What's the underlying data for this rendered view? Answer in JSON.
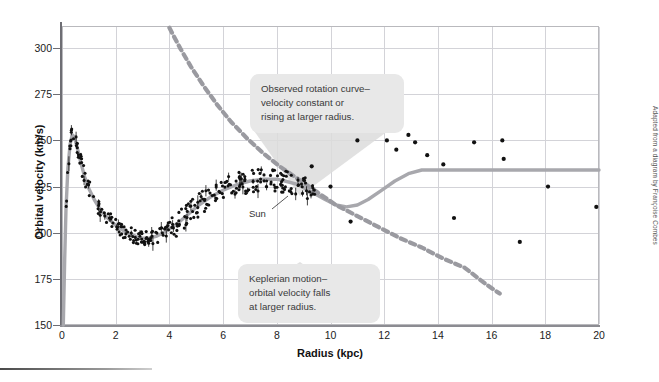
{
  "chart_data": {
    "type": "scatter",
    "title": "",
    "xlabel": "Radius (kpc)",
    "ylabel": "Orbital velocity (km/s)",
    "xlim": [
      0,
      20
    ],
    "ylim": [
      150,
      312
    ],
    "xticks": [
      0,
      2,
      4,
      6,
      8,
      10,
      12,
      14,
      16,
      18,
      20
    ],
    "yticks": [
      150,
      175,
      200,
      225,
      250,
      275,
      300
    ],
    "grid": true,
    "legend": "none",
    "series": [
      {
        "name": "Observed rotation curve (model)",
        "type": "line",
        "style": "solid",
        "color": "#a8a8ad",
        "points": [
          [
            0.05,
            150
          ],
          [
            0.1,
            186
          ],
          [
            0.15,
            213
          ],
          [
            0.22,
            235
          ],
          [
            0.3,
            248
          ],
          [
            0.38,
            253
          ],
          [
            0.46,
            252
          ],
          [
            0.55,
            247
          ],
          [
            0.7,
            238
          ],
          [
            0.85,
            230
          ],
          [
            1.0,
            224
          ],
          [
            1.2,
            218
          ],
          [
            1.45,
            212
          ],
          [
            1.7,
            208
          ],
          [
            2.0,
            204
          ],
          [
            2.3,
            201
          ],
          [
            2.6,
            199
          ],
          [
            2.9,
            197
          ],
          [
            3.2,
            197
          ],
          [
            3.5,
            198
          ],
          [
            3.9,
            201
          ],
          [
            4.3,
            205
          ],
          [
            4.7,
            210
          ],
          [
            5.1,
            215
          ],
          [
            5.5,
            219
          ],
          [
            6.0,
            223
          ],
          [
            6.5,
            226
          ],
          [
            7.0,
            228
          ],
          [
            7.5,
            229
          ],
          [
            8.0,
            229
          ],
          [
            8.3,
            228
          ],
          [
            8.8,
            226
          ],
          [
            9.3,
            222
          ],
          [
            9.8,
            218
          ],
          [
            10.2,
            215
          ],
          [
            10.6,
            214
          ],
          [
            11.0,
            215
          ],
          [
            11.4,
            218
          ],
          [
            11.9,
            223
          ],
          [
            12.4,
            228
          ],
          [
            12.9,
            232
          ],
          [
            13.4,
            234
          ],
          [
            14.0,
            234
          ],
          [
            15.0,
            234
          ],
          [
            16.0,
            234
          ],
          [
            17.0,
            234
          ],
          [
            18.0,
            234
          ],
          [
            19.0,
            234
          ],
          [
            20.0,
            234
          ]
        ]
      },
      {
        "name": "Keplerian motion",
        "type": "line",
        "style": "dashed",
        "color": "#9a9aa0",
        "points": [
          [
            4.0,
            311
          ],
          [
            4.4,
            300
          ],
          [
            4.8,
            290
          ],
          [
            5.3,
            279
          ],
          [
            5.8,
            269
          ],
          [
            6.3,
            260
          ],
          [
            6.9,
            251
          ],
          [
            7.5,
            243
          ],
          [
            8.1,
            236
          ],
          [
            8.8,
            229
          ],
          [
            9.5,
            222
          ],
          [
            10.2,
            215
          ],
          [
            11.0,
            209
          ],
          [
            11.8,
            203
          ],
          [
            12.6,
            197
          ],
          [
            13.4,
            192
          ],
          [
            14.2,
            186
          ],
          [
            15.0,
            181
          ],
          [
            15.8,
            172
          ],
          [
            16.3,
            167
          ]
        ]
      },
      {
        "name": "Observed data points (outer)",
        "type": "scatter",
        "color": "#111111",
        "points": [
          [
            10.0,
            225
          ],
          [
            11.0,
            250
          ],
          [
            11.35,
            264
          ],
          [
            11.62,
            264
          ],
          [
            12.1,
            250
          ],
          [
            12.45,
            245
          ],
          [
            12.9,
            253
          ],
          [
            13.15,
            249
          ],
          [
            13.6,
            242
          ],
          [
            14.2,
            237
          ],
          [
            14.6,
            208
          ],
          [
            15.35,
            249
          ],
          [
            16.4,
            250
          ],
          [
            16.45,
            240
          ],
          [
            17.05,
            195
          ],
          [
            18.1,
            225
          ],
          [
            19.9,
            214
          ],
          [
            9.3,
            236
          ],
          [
            10.75,
            206
          ]
        ]
      }
    ],
    "annotations": [
      {
        "name": "observed-callout",
        "lines": [
          "Observed rotation curve–",
          "velocity constant or",
          "rising at larger radius."
        ]
      },
      {
        "name": "keplerian-callout",
        "lines": [
          "Keplerian motion–",
          "orbital velocity falls",
          "at larger radius."
        ]
      },
      {
        "name": "sun-marker",
        "text": "Sun",
        "x": 8.3,
        "y": 220
      }
    ],
    "credit": "Adapted from a diagram by Françoise Combes"
  },
  "axes": {
    "y_title": "Orbital velocity (km/s)",
    "x_title": "Radius (kpc)",
    "y_labels": [
      "300",
      "275",
      "250",
      "225",
      "200",
      "175",
      "150"
    ],
    "x_labels": [
      "0",
      "2",
      "4",
      "6",
      "8",
      "10",
      "12",
      "14",
      "16",
      "18",
      "20"
    ]
  },
  "colors": {
    "curve": "#a8a8ad",
    "dashed": "#9a9aa0",
    "points": "#111111",
    "grid": "#d3d3d8",
    "callout_bg": "#e8e8e8",
    "callout_text": "#3a3a3a"
  },
  "labels": {
    "sun": "Sun",
    "credit": "Adapted from a diagram by Françoise Combes"
  }
}
